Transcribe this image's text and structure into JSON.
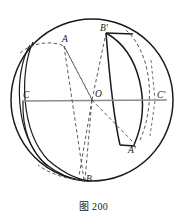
{
  "figure": {
    "caption": "图 200",
    "colors": {
      "outline": "#1a1a1a",
      "dashed": "#4a4a4a",
      "axis": "#8c8c8c",
      "background": "#ffffff",
      "label": "#1a1a1a"
    },
    "labels": [
      {
        "id": "A",
        "text": "A",
        "x": 62,
        "y": 35
      },
      {
        "id": "Bp",
        "text": "B'",
        "x": 100,
        "y": 24
      },
      {
        "id": "C",
        "text": "C",
        "x": 23,
        "y": 92
      },
      {
        "id": "O",
        "text": "O",
        "x": 95,
        "y": 91
      },
      {
        "id": "Cp",
        "text": "C'",
        "x": 157,
        "y": 92
      },
      {
        "id": "Ap",
        "text": "A'",
        "x": 128,
        "y": 147
      },
      {
        "id": "B",
        "text": "B",
        "x": 86,
        "y": 176
      }
    ],
    "points": {
      "center": {
        "name": "O",
        "x": 92,
        "y": 100
      },
      "A": {
        "x": 64,
        "y": 46
      },
      "Bp": {
        "x": 106,
        "y": 33
      },
      "C": {
        "x": 22,
        "y": 101
      },
      "Cp": {
        "x": 156,
        "y": 100
      },
      "Ap": {
        "x": 135,
        "y": 145
      },
      "B": {
        "x": 85,
        "y": 180
      }
    },
    "sphere": {
      "cx": 92,
      "cy": 100,
      "r": 81
    },
    "axis_line": {
      "x1": 22,
      "y1": 101,
      "x2": 167,
      "y2": 100
    }
  }
}
